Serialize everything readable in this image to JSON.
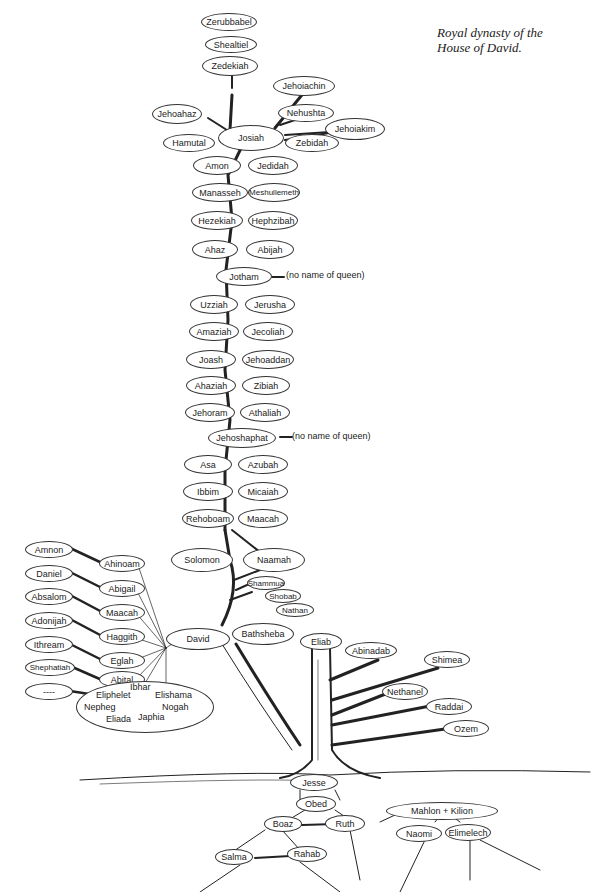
{
  "caption": {
    "line1": "Royal dynasty of the",
    "line2": "House of David."
  },
  "top": {
    "zerubbabel": "Zerubbabel",
    "shealtiel": "Shealtiel",
    "zedekiah": "Zedekiah",
    "jehoiachin": "Jehoiachin",
    "nehushta": "Nehushta",
    "jehoiakim": "Jehoiakim",
    "zebidah": "Zebidah",
    "jehoahaz": "Jehoahaz",
    "hamutal": "Hamutal",
    "josiah": "Josiah"
  },
  "kings": [
    {
      "king": "Amon",
      "queen": "Jedidah"
    },
    {
      "king": "Manasseh",
      "queen": "Meshullemeth"
    },
    {
      "king": "Hezekiah",
      "queen": "Hephzibah"
    },
    {
      "king": "Ahaz",
      "queen": "Abijah"
    },
    {
      "king": "Jotham",
      "queen": "(no name of queen)"
    },
    {
      "king": "Uzziah",
      "queen": "Jerusha"
    },
    {
      "king": "Amaziah",
      "queen": "Jecoliah"
    },
    {
      "king": "Joash",
      "queen": "Jehoaddan"
    },
    {
      "king": "Ahaziah",
      "queen": "Zibiah"
    },
    {
      "king": "Jehoram",
      "queen": "Athaliah"
    },
    {
      "king": "Jehoshaphat",
      "queen": "(no name of queen)"
    },
    {
      "king": "Asa",
      "queen": "Azubah"
    },
    {
      "king": "Ibbim",
      "queen": "Micaiah"
    },
    {
      "king": "Rehoboam",
      "queen": "Maacah"
    },
    {
      "king": "Solomon",
      "queen": "Naamah"
    }
  ],
  "bathsheba_sons": [
    "Shammua",
    "Shobab",
    "Nathan"
  ],
  "david": "David",
  "bathsheba": "Bathsheba",
  "david_wives": [
    {
      "son": "Amnon",
      "wife": "Ahinoam"
    },
    {
      "son": "Daniel",
      "wife": "Abigail"
    },
    {
      "son": "Absalom",
      "wife": "Maacah"
    },
    {
      "son": "Adonijah",
      "wife": "Haggith"
    },
    {
      "son": "Ithream",
      "wife": "Eglah"
    },
    {
      "son": "Shephatiah",
      "wife": "Abital"
    },
    {
      "son": "----",
      "wife": "Michal"
    }
  ],
  "other_sons": [
    "Ibhar",
    "Eliphelet",
    "Elishama",
    "Nepheg",
    "Nogah",
    "Eliada",
    "Japhia"
  ],
  "jesse_sons": [
    "Eliab",
    "Abinadab",
    "Shimea",
    "Nethanel",
    "Raddai",
    "Ozem"
  ],
  "roots": {
    "jesse": "Jesse",
    "obed": "Obed",
    "boaz": "Boaz",
    "ruth": "Ruth",
    "salma": "Salma",
    "rahab": "Rahab",
    "mahlon_kilion": "Mahlon + Kilion",
    "naomi": "Naomi",
    "elimelech": "Elimelech"
  }
}
